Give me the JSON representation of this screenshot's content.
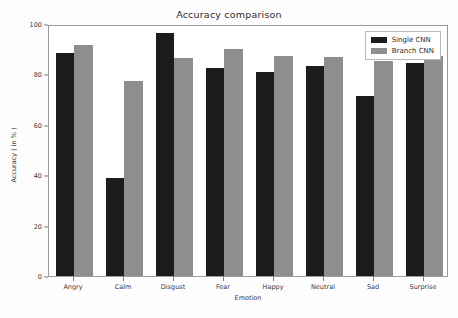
{
  "chart_data": {
    "type": "bar",
    "title": "Accuracy comparison",
    "xlabel": "Emotion",
    "ylabel": "Accuracy ( in % )",
    "categories": [
      "Angry",
      "Calm",
      "Disgust",
      "Fear",
      "Happy",
      "Neutral",
      "Sad",
      "Surprise"
    ],
    "series": [
      {
        "name": "Single CNN",
        "color": "#1c1c1c",
        "values": [
          88.5,
          39.0,
          96.5,
          82.5,
          81.0,
          83.5,
          71.5,
          84.5
        ]
      },
      {
        "name": "Branch CNN",
        "color": "#8e8e8e",
        "values": [
          91.5,
          77.5,
          86.5,
          90.0,
          87.5,
          87.0,
          85.5,
          87.5
        ]
      }
    ],
    "ylim": [
      0,
      100
    ],
    "yticks": [
      0,
      20,
      40,
      60,
      80,
      100
    ],
    "ytick_labels": [
      "0",
      "20",
      "40",
      "60",
      "80",
      "100"
    ],
    "grid": false,
    "legend_position": "upper right"
  },
  "figure": {
    "background_color": "#fdfdfd",
    "plot_background_color": "#ffffff",
    "axis_color": "#9a9a9a"
  }
}
